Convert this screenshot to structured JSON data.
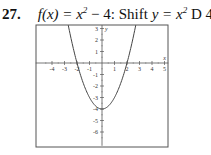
{
  "problem": {
    "number": "27.",
    "function": "f(x) = x",
    "function_exp": "2",
    "function_tail": " − 4:",
    "instruction": "Shift",
    "instruction_math": "y = x",
    "instruction_exp": "2",
    "instruction_tail": " D 4."
  },
  "chart_data": {
    "type": "line",
    "title": "",
    "function": "x^2 - 4",
    "xlabel": "x",
    "ylabel": "y",
    "xlim": [
      -5.3,
      5.3
    ],
    "ylim": [
      -7.2,
      3.3
    ],
    "x_ticks": [
      -4,
      -3,
      -2,
      -1,
      1,
      2,
      3,
      4,
      5
    ],
    "y_ticks": [
      3,
      2,
      1,
      -1,
      -2,
      -3,
      -4,
      -5,
      -6
    ],
    "x_tick_labels": [
      "-4",
      "-3",
      "-2",
      "-1",
      "1",
      "2",
      "3",
      "4",
      "5"
    ],
    "y_tick_labels": [
      "3",
      "2",
      "1",
      "-1",
      "-2",
      "-3",
      "-4",
      "-5",
      "-6"
    ],
    "grid": false,
    "series": [
      {
        "name": "f(x) = x^2 - 4",
        "x": [
          -2.7,
          -2.5,
          -2,
          -1.5,
          -1,
          -0.5,
          0,
          0.5,
          1,
          1.5,
          2,
          2.5,
          2.7
        ],
        "y": [
          3.29,
          2.25,
          0,
          -1.75,
          -3,
          -3.75,
          -4,
          -3.75,
          -3,
          -1.75,
          0,
          2.25,
          3.29
        ]
      }
    ],
    "colors": {
      "curve": "#444444",
      "axes": "#555555",
      "frame": "#555555"
    }
  }
}
